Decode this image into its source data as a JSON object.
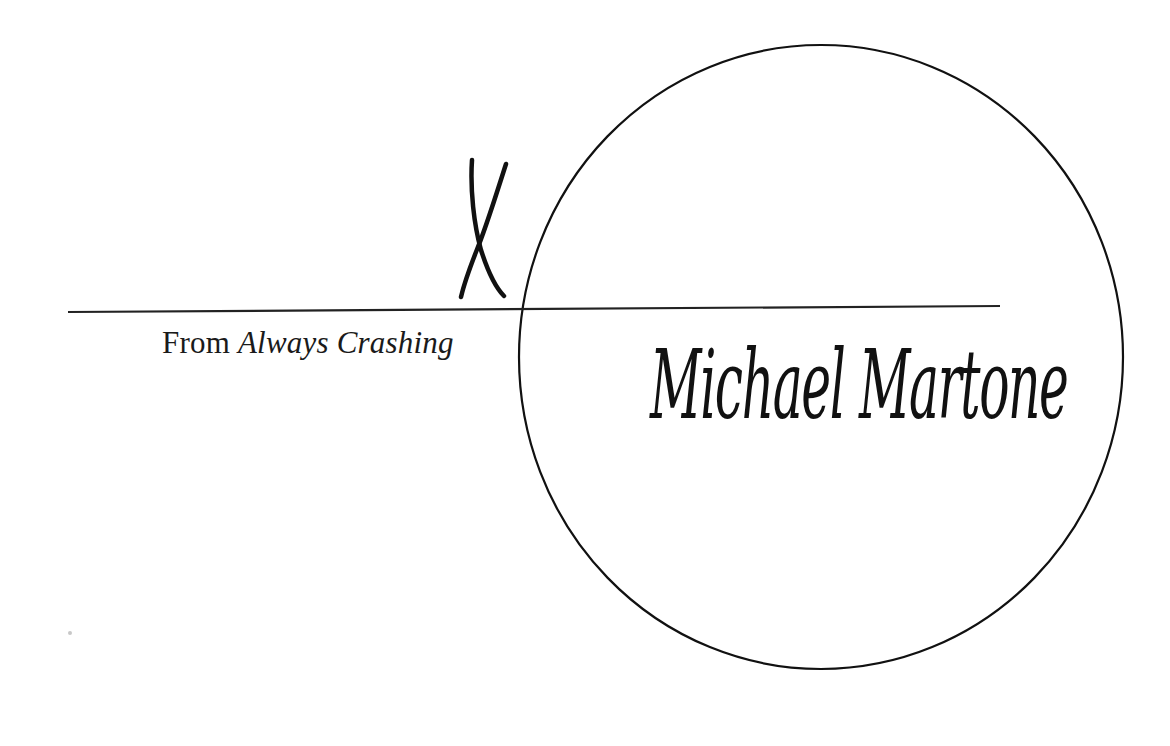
{
  "title_mark": "X",
  "caption": {
    "prefix": "From",
    "book_title": "Always Crashing"
  },
  "author": "Michael Martone",
  "colors": {
    "ink": "#111111",
    "background": "#ffffff"
  }
}
